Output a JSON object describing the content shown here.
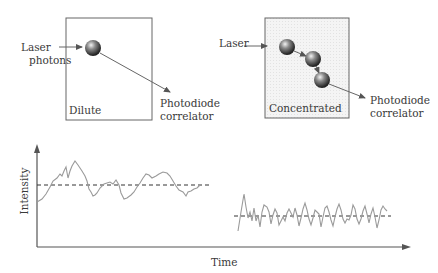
{
  "panels": {
    "dilute": {
      "box_label": "Dilute",
      "input_label_line1": "Laser",
      "input_label_line2": "photons",
      "output_label_line1": "Photodiode",
      "output_label_line2": "correlator"
    },
    "concentrated": {
      "box_label": "Concentrated",
      "input_label": "Laser",
      "output_label_line1": "Photodiode",
      "output_label_line2": "correlator"
    }
  },
  "graph": {
    "ylabel": "Intensity",
    "xlabel": "Time",
    "traces": [
      {
        "name": "dilute-trace",
        "description": "slow, large fluctuations about mean"
      },
      {
        "name": "concentrated-trace",
        "description": "fast, rapid fluctuations about mean"
      }
    ],
    "colors": {
      "trace": "#9a9a9a",
      "axis": "#555555",
      "mean_line": "#333333"
    }
  },
  "icons": {
    "particle": "sphere-icon",
    "arrow": "arrow-icon"
  }
}
